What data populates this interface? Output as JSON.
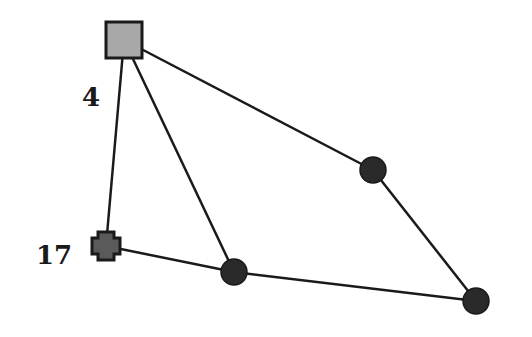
{
  "diagram": {
    "type": "graph",
    "colors": {
      "background": "#ffffff",
      "edge": "#1a1a1a",
      "square_fill": "#a8a8a8",
      "cross_fill": "#5a5a5a",
      "circle_fill": "#2a2a2a",
      "stroke": "#1a1a1a"
    },
    "nodes": [
      {
        "id": "n_square",
        "shape": "square",
        "x": 124,
        "y": 40,
        "label": "4",
        "label_x": 82,
        "label_y": 106
      },
      {
        "id": "n_cross",
        "shape": "cross",
        "x": 106,
        "y": 246,
        "label": "17",
        "label_x": 36,
        "label_y": 264
      },
      {
        "id": "n_c1",
        "shape": "circle",
        "x": 373,
        "y": 170,
        "label": ""
      },
      {
        "id": "n_c2",
        "shape": "circle",
        "x": 234,
        "y": 272,
        "label": ""
      },
      {
        "id": "n_c3",
        "shape": "circle",
        "x": 476,
        "y": 301,
        "label": ""
      }
    ],
    "edges": [
      {
        "from": "n_square",
        "to": "n_cross"
      },
      {
        "from": "n_square",
        "to": "n_c2"
      },
      {
        "from": "n_square",
        "to": "n_c1"
      },
      {
        "from": "n_c1",
        "to": "n_c3"
      },
      {
        "from": "n_cross",
        "to": "n_c2"
      },
      {
        "from": "n_c2",
        "to": "n_c3"
      }
    ]
  }
}
